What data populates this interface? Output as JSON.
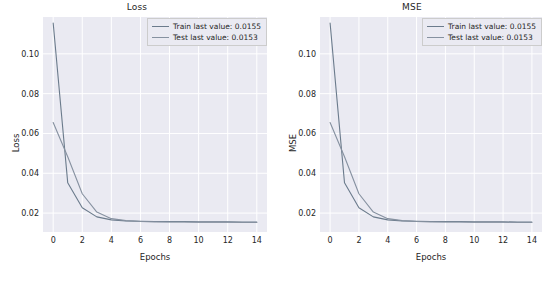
{
  "figure": {
    "background": "#ffffff",
    "panel_background": "#eaeaf2",
    "grid_color": "#ffffff",
    "text_color": "#262626"
  },
  "chart_data": [
    {
      "type": "line",
      "title": "Loss",
      "xlabel": "Epochs",
      "ylabel": "Loss",
      "xlim": [
        -0.7,
        14.7
      ],
      "ylim": [
        0.0105,
        0.1185
      ],
      "xticks": [
        0,
        2,
        4,
        6,
        8,
        10,
        12,
        14
      ],
      "xticklabels": [
        "0",
        "2",
        "4",
        "6",
        "8",
        "10",
        "12",
        "14"
      ],
      "yticks": [
        0.02,
        0.04,
        0.06,
        0.08,
        0.1
      ],
      "yticklabels": [
        "0.02",
        "0.04",
        "0.06",
        "0.08",
        "0.10"
      ],
      "grid": true,
      "legend_position": "upper right",
      "x": [
        0,
        1,
        2,
        3,
        4,
        5,
        6,
        7,
        8,
        9,
        10,
        11,
        12,
        13,
        14
      ],
      "series": [
        {
          "name": "Train last value: 0.0155",
          "color": "#6b7b8c",
          "values": [
            0.1155,
            0.0352,
            0.0227,
            0.0181,
            0.0166,
            0.0161,
            0.0159,
            0.0158,
            0.0157,
            0.0157,
            0.0156,
            0.0156,
            0.0156,
            0.0155,
            0.0155
          ]
        },
        {
          "name": "Test last value: 0.0153",
          "color": "#8691a0",
          "values": [
            0.0655,
            0.0483,
            0.0297,
            0.0205,
            0.0172,
            0.0162,
            0.0158,
            0.0156,
            0.0155,
            0.0155,
            0.0154,
            0.0154,
            0.0154,
            0.0153,
            0.0153
          ]
        }
      ]
    },
    {
      "type": "line",
      "title": "MSE",
      "xlabel": "Epochs",
      "ylabel": "MSE",
      "xlim": [
        -0.7,
        14.7
      ],
      "ylim": [
        0.0105,
        0.1185
      ],
      "xticks": [
        0,
        2,
        4,
        6,
        8,
        10,
        12,
        14
      ],
      "xticklabels": [
        "0",
        "2",
        "4",
        "6",
        "8",
        "10",
        "12",
        "14"
      ],
      "yticks": [
        0.02,
        0.04,
        0.06,
        0.08,
        0.1
      ],
      "yticklabels": [
        "0.02",
        "0.04",
        "0.06",
        "0.08",
        "0.10"
      ],
      "grid": true,
      "legend_position": "upper right",
      "x": [
        0,
        1,
        2,
        3,
        4,
        5,
        6,
        7,
        8,
        9,
        10,
        11,
        12,
        13,
        14
      ],
      "series": [
        {
          "name": "Train last value: 0.0155",
          "color": "#6b7b8c",
          "values": [
            0.1155,
            0.0352,
            0.0227,
            0.0181,
            0.0166,
            0.0161,
            0.0159,
            0.0158,
            0.0157,
            0.0157,
            0.0156,
            0.0156,
            0.0156,
            0.0155,
            0.0155
          ]
        },
        {
          "name": "Test last value: 0.0153",
          "color": "#8691a0",
          "values": [
            0.0655,
            0.0483,
            0.0297,
            0.0205,
            0.0172,
            0.0162,
            0.0158,
            0.0156,
            0.0155,
            0.0155,
            0.0154,
            0.0154,
            0.0154,
            0.0153,
            0.0153
          ]
        }
      ]
    }
  ]
}
